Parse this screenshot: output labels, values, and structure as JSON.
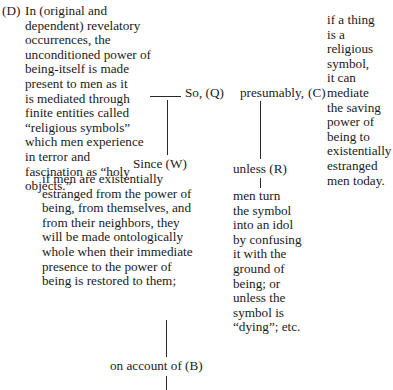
{
  "diagram": {
    "type": "toulmin-argument",
    "data_D": {
      "label": "(D)",
      "lines": [
        "In (original and",
        "dependent) revelatory",
        "occurrences, the",
        "unconditioned power of",
        "being-itself is made",
        "present to men as it",
        "is mediated through",
        "finite entities called",
        "“religious symbols”",
        "which men experience",
        "in terror and",
        "fascination as “holy",
        "objects.”"
      ]
    },
    "so_connector": "So, (Q)",
    "qualifier": "presumably,",
    "claim_C": {
      "label": "(C)",
      "lines": [
        "if a thing",
        "is a",
        "religious",
        "symbol,",
        "it can",
        "mediate",
        "the saving",
        "power of",
        "being to",
        "existentially",
        "estranged",
        "men today."
      ]
    },
    "warrant_W": {
      "connector": "Since (W)",
      "lines": [
        "if men are existentially",
        "estranged from the power of",
        "being, from themselves, and",
        "from their neighbors, they",
        "will be made ontologically",
        "whole when their immediate",
        "presence to the power of",
        "being is restored to them;"
      ]
    },
    "rebuttal_R": {
      "connector": "unless (R)",
      "lines": [
        "men turn",
        "the symbol",
        "into an idol",
        "by confusing",
        "it with the",
        "ground of",
        "being; or",
        "unless the",
        "symbol is",
        "“dying”; etc."
      ]
    },
    "backing_B": {
      "connector": "on account of (B)"
    }
  }
}
